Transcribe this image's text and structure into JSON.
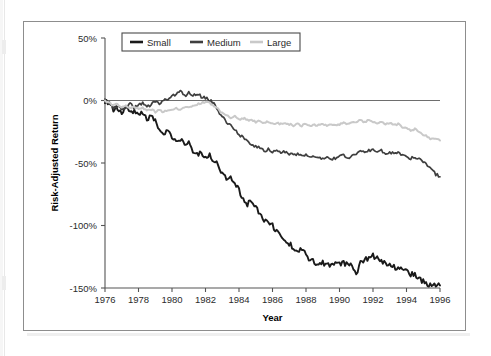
{
  "figure": {
    "background_color": "#ffffff",
    "frame_color": "#8d8d8d"
  },
  "legend": {
    "position": "top-left-inside",
    "entries": [
      {
        "label": "Small",
        "color": "#1a1a1a"
      },
      {
        "label": "Medium",
        "color": "#3f3f3f"
      },
      {
        "label": "Large",
        "color": "#c9c9c9"
      }
    ]
  },
  "chart_data": {
    "type": "line",
    "title": "",
    "xlabel": "Year",
    "ylabel": "Risk-Adjusted Return",
    "xlim": [
      1976,
      1996
    ],
    "ylim": [
      -150,
      50
    ],
    "grid": false,
    "zero_reference_line": true,
    "legend_position": "upper left",
    "xticks": [
      1976,
      1978,
      1980,
      1982,
      1984,
      1986,
      1988,
      1990,
      1992,
      1994,
      1996
    ],
    "xtick_labels": [
      "1976",
      "1978",
      "1980",
      "1982",
      "1984",
      "1986",
      "1988",
      "1990",
      "1992",
      "1994",
      "1996"
    ],
    "yticks": [
      50,
      0,
      -50,
      -100,
      -150
    ],
    "ytick_labels": [
      "50%",
      "0%",
      "-50%",
      "-100%",
      "-150%"
    ],
    "x_unit": "year",
    "y_unit": "percent",
    "series": [
      {
        "name": "Small",
        "color": "#1a1a1a",
        "width": 1.9,
        "x": [
          1976.0,
          1976.25,
          1976.5,
          1976.75,
          1977.0,
          1977.25,
          1977.5,
          1977.75,
          1978.0,
          1978.25,
          1978.5,
          1978.75,
          1979.0,
          1979.25,
          1979.5,
          1979.75,
          1980.0,
          1980.25,
          1980.5,
          1980.75,
          1981.0,
          1981.25,
          1981.5,
          1981.75,
          1982.0,
          1982.25,
          1982.5,
          1982.75,
          1983.0,
          1983.25,
          1983.5,
          1983.75,
          1984.0,
          1984.25,
          1984.5,
          1984.75,
          1985.0,
          1985.25,
          1985.5,
          1985.75,
          1986.0,
          1986.25,
          1986.5,
          1986.75,
          1987.0,
          1987.25,
          1987.5,
          1987.75,
          1988.0,
          1988.25,
          1988.5,
          1988.75,
          1989.0,
          1989.25,
          1989.5,
          1989.75,
          1990.0,
          1990.25,
          1990.5,
          1990.75,
          1991.0,
          1991.25,
          1991.5,
          1991.75,
          1992.0,
          1992.25,
          1992.5,
          1992.75,
          1993.0,
          1993.25,
          1993.5,
          1993.75,
          1994.0,
          1994.25,
          1994.5,
          1994.75,
          1995.0,
          1995.25,
          1995.5,
          1995.75,
          1996.0
        ],
        "y": [
          0,
          -3,
          -8,
          -6,
          -9,
          -5,
          -10,
          -8,
          -12,
          -9,
          -14,
          -13,
          -17,
          -22,
          -26,
          -24,
          -30,
          -33,
          -31,
          -36,
          -34,
          -40,
          -44,
          -41,
          -45,
          -43,
          -48,
          -52,
          -58,
          -63,
          -60,
          -67,
          -72,
          -78,
          -83,
          -80,
          -86,
          -91,
          -95,
          -98,
          -100,
          -104,
          -108,
          -111,
          -114,
          -118,
          -121,
          -119,
          -124,
          -127,
          -129,
          -131,
          -130,
          -132,
          -131,
          -130,
          -131,
          -130,
          -132,
          -131,
          -140,
          -130,
          -128,
          -126,
          -124,
          -126,
          -129,
          -130,
          -131,
          -133,
          -134,
          -136,
          -137,
          -139,
          -140,
          -142,
          -145,
          -148,
          -147,
          -149,
          -148
        ]
      },
      {
        "name": "Medium",
        "color": "#3f3f3f",
        "width": 1.7,
        "x": [
          1976.0,
          1976.25,
          1976.5,
          1976.75,
          1977.0,
          1977.25,
          1977.5,
          1977.75,
          1978.0,
          1978.25,
          1978.5,
          1978.75,
          1979.0,
          1979.25,
          1979.5,
          1979.75,
          1980.0,
          1980.25,
          1980.5,
          1980.75,
          1981.0,
          1981.25,
          1981.5,
          1981.75,
          1982.0,
          1982.25,
          1982.5,
          1982.75,
          1983.0,
          1983.25,
          1983.5,
          1983.75,
          1984.0,
          1984.25,
          1984.5,
          1984.75,
          1985.0,
          1985.25,
          1985.5,
          1985.75,
          1986.0,
          1986.25,
          1986.5,
          1986.75,
          1987.0,
          1987.25,
          1987.5,
          1987.75,
          1988.0,
          1988.25,
          1988.5,
          1988.75,
          1989.0,
          1989.25,
          1989.5,
          1989.75,
          1990.0,
          1990.25,
          1990.5,
          1990.75,
          1991.0,
          1991.25,
          1991.5,
          1991.75,
          1992.0,
          1992.25,
          1992.5,
          1992.75,
          1993.0,
          1993.25,
          1993.5,
          1993.75,
          1994.0,
          1994.25,
          1994.5,
          1994.75,
          1995.0,
          1995.25,
          1995.5,
          1995.75,
          1996.0
        ],
        "y": [
          0,
          -2,
          -6,
          -4,
          -7,
          -5,
          -3,
          -6,
          -4,
          -2,
          -5,
          -3,
          -1,
          -2,
          0,
          1,
          3,
          5,
          7,
          4,
          6,
          4,
          6,
          3,
          2,
          0,
          -2,
          -8,
          -13,
          -17,
          -20,
          -24,
          -27,
          -30,
          -33,
          -35,
          -37,
          -38,
          -40,
          -39,
          -41,
          -40,
          -42,
          -41,
          -43,
          -44,
          -43,
          -45,
          -44,
          -45,
          -46,
          -45,
          -47,
          -46,
          -47,
          -46,
          -45,
          -44,
          -46,
          -44,
          -42,
          -41,
          -42,
          -40,
          -39,
          -41,
          -40,
          -42,
          -41,
          -43,
          -42,
          -44,
          -45,
          -46,
          -45,
          -47,
          -49,
          -52,
          -56,
          -59,
          -61
        ]
      },
      {
        "name": "Large",
        "color": "#c9c9c9",
        "width": 2.0,
        "x": [
          1976.0,
          1976.25,
          1976.5,
          1976.75,
          1977.0,
          1977.25,
          1977.5,
          1977.75,
          1978.0,
          1978.25,
          1978.5,
          1978.75,
          1979.0,
          1979.25,
          1979.5,
          1979.75,
          1980.0,
          1980.25,
          1980.5,
          1980.75,
          1981.0,
          1981.25,
          1981.5,
          1981.75,
          1982.0,
          1982.25,
          1982.5,
          1982.75,
          1983.0,
          1983.25,
          1983.5,
          1983.75,
          1984.0,
          1984.25,
          1984.5,
          1984.75,
          1985.0,
          1985.25,
          1985.5,
          1985.75,
          1986.0,
          1986.25,
          1986.5,
          1986.75,
          1987.0,
          1987.25,
          1987.5,
          1987.75,
          1988.0,
          1988.25,
          1988.5,
          1988.75,
          1989.0,
          1989.25,
          1989.5,
          1989.75,
          1990.0,
          1990.25,
          1990.5,
          1990.75,
          1991.0,
          1991.25,
          1991.5,
          1991.75,
          1992.0,
          1992.25,
          1992.5,
          1992.75,
          1993.0,
          1993.25,
          1993.5,
          1993.75,
          1994.0,
          1994.25,
          1994.5,
          1994.75,
          1995.0,
          1995.25,
          1995.5,
          1995.75,
          1996.0
        ],
        "y": [
          0,
          -2,
          -4,
          -3,
          -5,
          -4,
          -6,
          -5,
          -7,
          -6,
          -8,
          -7,
          -9,
          -8,
          -9,
          -8,
          -7,
          -6,
          -7,
          -6,
          -5,
          -4,
          -3,
          -2,
          -1,
          -2,
          -4,
          -7,
          -10,
          -12,
          -14,
          -13,
          -15,
          -14,
          -16,
          -15,
          -17,
          -16,
          -18,
          -17,
          -19,
          -18,
          -19,
          -18,
          -19,
          -20,
          -19,
          -20,
          -19,
          -20,
          -19,
          -20,
          -19,
          -20,
          -19,
          -20,
          -19,
          -18,
          -19,
          -18,
          -17,
          -16,
          -17,
          -16,
          -17,
          -18,
          -17,
          -19,
          -18,
          -20,
          -19,
          -21,
          -22,
          -24,
          -23,
          -25,
          -27,
          -29,
          -31,
          -30,
          -32
        ]
      }
    ]
  }
}
